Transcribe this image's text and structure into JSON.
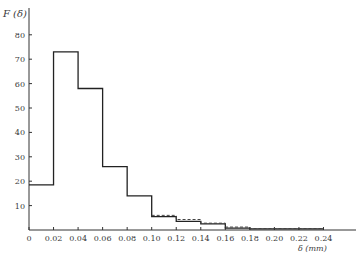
{
  "chart_data": {
    "type": "bar",
    "style": "step-histogram",
    "title": "",
    "ylabel": "F (δ)",
    "xlabel": "δ (mm)",
    "xlim": [
      0,
      0.26
    ],
    "ylim": [
      0,
      85
    ],
    "grid": false,
    "legend": null,
    "x_ticks": [
      "0",
      "0.02",
      "0.04",
      "0.06",
      "0.08",
      "0.10",
      "0.12",
      "0.14",
      "0.16",
      "0.18",
      "0.20",
      "0.22",
      "0.24"
    ],
    "y_ticks": [
      "10",
      "20",
      "30",
      "40",
      "50",
      "60",
      "70",
      "80"
    ],
    "bin_edges": [
      0,
      0.02,
      0.04,
      0.06,
      0.08,
      0.1,
      0.12,
      0.14,
      0.16,
      0.18,
      0.2,
      0.22,
      0.24
    ],
    "categories": [
      "0-0.02",
      "0.02-0.04",
      "0.04-0.06",
      "0.06-0.08",
      "0.08-0.10",
      "0.10-0.12",
      "0.12-0.14",
      "0.14-0.16",
      "0.16-0.18",
      "0.18-0.20",
      "0.20-0.22",
      "0.22-0.24"
    ],
    "series": [
      {
        "name": "histogram (solid)",
        "line": "solid",
        "values": [
          18.5,
          73,
          58,
          26,
          14,
          5.5,
          3.5,
          2.5,
          0.8,
          0.5,
          0.5,
          0.5
        ]
      },
      {
        "name": "fitted (dashed)",
        "line": "dashed",
        "values": [
          null,
          null,
          null,
          null,
          null,
          6,
          4.3,
          2.8,
          1.2,
          0.6,
          0.6,
          0.6
        ]
      }
    ]
  },
  "axes": {
    "y_label": "F (δ)",
    "x_label": "δ (mm)"
  }
}
